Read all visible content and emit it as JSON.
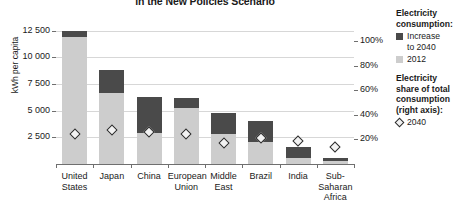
{
  "chart_data": {
    "type": "bar",
    "subtype": "stacked-bar-with-scatter-overlay",
    "title": "in the New Policies Scenario",
    "xlabel": "",
    "ylabel": "kWh per capita",
    "ylim": [
      0,
      13500
    ],
    "yticks": [
      2500,
      5000,
      7500,
      10000,
      12500
    ],
    "ytick_labels": [
      "2 500",
      "5 000",
      "7 500",
      "10 000",
      "12 500"
    ],
    "y2label": "Electricity share of total consumption (right axis)",
    "y2lim": [
      0,
      117
    ],
    "y2ticks": [
      20,
      40,
      60,
      80,
      100
    ],
    "y2tick_labels": [
      "20%",
      "40%",
      "60%",
      "80%",
      "100%"
    ],
    "grid": true,
    "legend_position": "right",
    "categories": [
      "United States",
      "Japan",
      "China",
      "European Union",
      "Middle East",
      "Brazil",
      "India",
      "Sub-Saharan Africa"
    ],
    "category_lines": [
      [
        "United",
        "States"
      ],
      [
        "Japan"
      ],
      [
        "China"
      ],
      [
        "European",
        "Union"
      ],
      [
        "Middle",
        "East"
      ],
      [
        "Brazil"
      ],
      [
        "India"
      ],
      [
        "Sub-",
        "Saharan",
        "Africa"
      ]
    ],
    "series": [
      {
        "name": "2012",
        "color": "#cdcdcd",
        "values": [
          11900,
          6680,
          2950,
          5210,
          2860,
          2080,
          610,
          260
        ]
      },
      {
        "name": "Increase to 2040",
        "color": "#4a4a4a",
        "values": [
          600,
          2090,
          3300,
          950,
          1910,
          2000,
          950,
          350
        ]
      }
    ],
    "totals_2040": [
      12500,
      8770,
      6250,
      6160,
      4770,
      4080,
      1560,
      610
    ],
    "marker_series": {
      "name": "2040",
      "axis": "right",
      "marker": "diamond",
      "unit": "%",
      "values": [
        24,
        28,
        26,
        24,
        17,
        21,
        19,
        14
      ]
    }
  },
  "legend": {
    "group1_title_line1": "Electricity",
    "group1_title_line2": "consumption:",
    "item_increase_line1": "Increase",
    "item_increase_line2": "to 2040",
    "item_2012": "2012",
    "group2_title_line1": "Electricity",
    "group2_title_line2": "share of total",
    "group2_title_line3": "consumption",
    "group2_title_line4": "(right axis):",
    "item_2040": "2040"
  }
}
